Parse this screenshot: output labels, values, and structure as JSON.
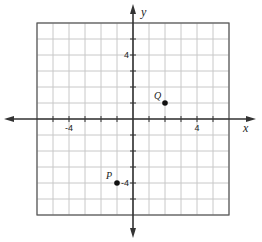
{
  "graph": {
    "x_axis_label": "x",
    "y_axis_label": "y",
    "x_range": [
      -6,
      6
    ],
    "y_range": [
      -6,
      6
    ],
    "tick_labels": {
      "x_neg": "-4",
      "x_pos": "4",
      "y_pos": "4",
      "y_neg": "-4"
    },
    "points": [
      {
        "name": "Q",
        "x": 2,
        "y": 1
      },
      {
        "name": "P",
        "x": -1,
        "y": -4
      }
    ],
    "colors": {
      "grid": "#c8c8c8",
      "axis": "#333333",
      "border": "#555555",
      "point": "#111111"
    }
  }
}
